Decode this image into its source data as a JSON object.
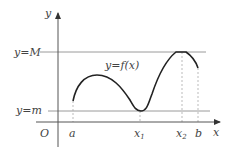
{
  "diagram": {
    "axis_labels": {
      "y": "y",
      "x": "x",
      "origin": "O"
    },
    "horizontal_lines": [
      {
        "label": "y=M",
        "name": "max-line"
      },
      {
        "label": "y=m",
        "name": "min-line"
      }
    ],
    "curve_label": "y=f(x)",
    "x_ticks": [
      {
        "label": "a",
        "sub": ""
      },
      {
        "label": "x",
        "sub": "1"
      },
      {
        "label": "x",
        "sub": "2"
      },
      {
        "label": "b",
        "sub": ""
      }
    ],
    "colors": {
      "axis": "#555555",
      "curve": "#222222",
      "guide": "#9a9a9a",
      "dashed": "#aaaaaa"
    }
  }
}
